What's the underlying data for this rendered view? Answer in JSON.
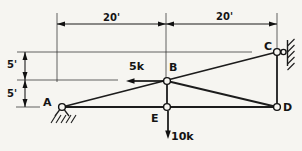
{
  "labels": {
    "joint_a": "A",
    "joint_b": "B",
    "joint_c": "C",
    "joint_d": "D",
    "joint_e": "E",
    "load_at_b": "5k",
    "load_at_e": "10k",
    "span_left": "20'",
    "span_right": "20'",
    "rise_upper": "5'",
    "rise_lower": "5'"
  },
  "figure": {
    "kind": "plane-truss-line-drawing",
    "joints": [
      "A",
      "B",
      "C",
      "D",
      "E"
    ],
    "members": [
      "A-E",
      "E-D",
      "A-B",
      "B-C",
      "B-E",
      "B-D",
      "C-D"
    ],
    "supports": [
      {
        "at": "A",
        "type": "pin",
        "ground": "hatched"
      },
      {
        "at": "C",
        "type": "roller-on-vertical-wall",
        "ground": "hatched"
      }
    ],
    "loads": [
      {
        "at": "B",
        "magnitude": "5k",
        "direction": "left"
      },
      {
        "at": "E",
        "magnitude": "10k",
        "direction": "down"
      }
    ],
    "dimensions": [
      {
        "span": "A to B horizontal",
        "value": "20'"
      },
      {
        "span": "B to C horizontal",
        "value": "20'"
      },
      {
        "span": "C to B vertical",
        "value": "5'"
      },
      {
        "span": "B to A vertical",
        "value": "5'"
      }
    ],
    "colors": {
      "ink": "#1c1c1c",
      "paper": "#f6f5f1"
    }
  }
}
